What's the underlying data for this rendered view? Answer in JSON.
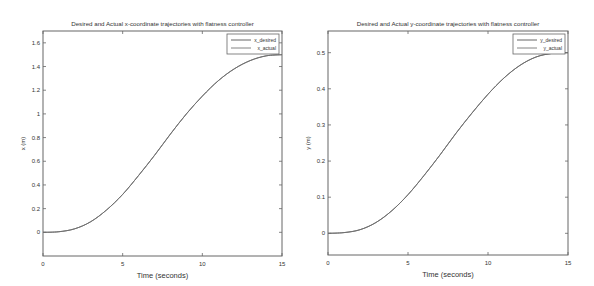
{
  "chart_data": [
    {
      "type": "line",
      "title": "Desired and Actual x-coordinate trajectories with flatness controller",
      "xlabel": "Time (seconds)",
      "ylabel": "x (m)",
      "xlim": [
        0,
        15
      ],
      "ylim": [
        -0.2,
        1.7
      ],
      "xticks": [
        0,
        5,
        10,
        15
      ],
      "yticks": [
        0,
        0.2,
        0.4,
        0.6,
        0.8,
        1,
        1.2,
        1.4,
        1.6
      ],
      "grid": false,
      "legend_position": "upper right",
      "x": [
        0,
        1,
        2,
        3,
        4,
        5,
        6,
        7,
        8,
        9,
        10,
        11,
        12,
        13,
        14,
        15
      ],
      "series": [
        {
          "name": "x_desired",
          "color": "#555555",
          "values": [
            0,
            0.005,
            0.03,
            0.09,
            0.19,
            0.32,
            0.48,
            0.65,
            0.83,
            1.0,
            1.15,
            1.28,
            1.38,
            1.45,
            1.49,
            1.5
          ]
        },
        {
          "name": "x_actual",
          "color": "#777777",
          "values": [
            0,
            0.005,
            0.03,
            0.09,
            0.19,
            0.32,
            0.48,
            0.65,
            0.83,
            1.0,
            1.15,
            1.28,
            1.38,
            1.45,
            1.49,
            1.5
          ]
        }
      ]
    },
    {
      "type": "line",
      "title": "Desired and Actual y-coordinate trajectories with flatness controller",
      "xlabel": "Time (seconds)",
      "ylabel": "y (m)",
      "xlim": [
        0,
        15
      ],
      "ylim": [
        -0.06,
        0.56
      ],
      "xticks": [
        0,
        5,
        10,
        15
      ],
      "yticks": [
        0,
        0.1,
        0.2,
        0.3,
        0.4,
        0.5
      ],
      "grid": false,
      "legend_position": "upper right",
      "x": [
        0,
        1,
        2,
        3,
        4,
        5,
        6,
        7,
        8,
        9,
        10,
        11,
        12,
        13,
        14,
        15
      ],
      "series": [
        {
          "name": "y_desired",
          "color": "#555555",
          "values": [
            0,
            0.002,
            0.01,
            0.03,
            0.063,
            0.107,
            0.16,
            0.217,
            0.277,
            0.333,
            0.385,
            0.43,
            0.465,
            0.488,
            0.498,
            0.5
          ]
        },
        {
          "name": "y_actual",
          "color": "#777777",
          "values": [
            0,
            0.002,
            0.01,
            0.03,
            0.063,
            0.107,
            0.16,
            0.217,
            0.277,
            0.333,
            0.385,
            0.43,
            0.465,
            0.488,
            0.498,
            0.5
          ]
        }
      ]
    }
  ]
}
